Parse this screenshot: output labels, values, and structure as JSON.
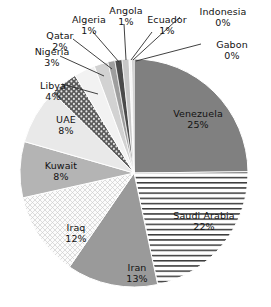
{
  "chart_data": {
    "type": "pie",
    "title": "",
    "subtitle": "",
    "xlabel": "",
    "ylabel": "",
    "grid": false,
    "legend": "none",
    "label_format": "name + percent",
    "units": "percent of total",
    "categories": [
      "Venezuela",
      "Saudi Arabia",
      "Iran",
      "Iraq",
      "Kuwait",
      "UAE",
      "Libya",
      "Nigeria",
      "Qatar",
      "Algeria",
      "Angola",
      "Ecuador",
      "Indonesia",
      "Gabon"
    ],
    "values": [
      25,
      22,
      13,
      12,
      8,
      8,
      4,
      3,
      2,
      1,
      1,
      1,
      0,
      0
    ],
    "slices": [
      {
        "name": "Venezuela",
        "value": 25,
        "label": "Venezuela",
        "percent": "25%",
        "fill": "#808080",
        "pattern": "solid"
      },
      {
        "name": "Saudi Arabia",
        "value": 22,
        "label": "Saudi Arabia",
        "percent": "22%",
        "fill": "#ffffff",
        "pattern": "horizontal-lines"
      },
      {
        "name": "Iran",
        "value": 13,
        "label": "Iran",
        "percent": "13%",
        "fill": "#9a9a9a",
        "pattern": "solid"
      },
      {
        "name": "Iraq",
        "value": 12,
        "label": "Iraq",
        "percent": "12%",
        "fill": "#fbfbfb",
        "pattern": "fine-grid"
      },
      {
        "name": "Kuwait",
        "value": 8,
        "label": "Kuwait",
        "percent": "8%",
        "fill": "#b4b4b4",
        "pattern": "solid"
      },
      {
        "name": "UAE",
        "value": 8,
        "label": "UAE",
        "percent": "8%",
        "fill": "#e9e9e9",
        "pattern": "solid"
      },
      {
        "name": "Libya",
        "value": 4,
        "label": "Libya",
        "percent": "4%",
        "fill": "#585858",
        "pattern": "dots"
      },
      {
        "name": "Nigeria",
        "value": 3,
        "label": "Nigeria",
        "percent": "3%",
        "fill": "#f2f2f2",
        "pattern": "solid"
      },
      {
        "name": "Qatar",
        "value": 2,
        "label": "Qatar",
        "percent": "2%",
        "fill": "#d2d2d2",
        "pattern": "solid"
      },
      {
        "name": "Algeria",
        "value": 1,
        "label": "Algeria",
        "percent": "1%",
        "fill": "#9e9e9e",
        "pattern": "solid"
      },
      {
        "name": "Angola",
        "value": 1,
        "label": "Angola",
        "percent": "1%",
        "fill": "#4a4a4a",
        "pattern": "solid"
      },
      {
        "name": "Ecuador",
        "value": 1,
        "label": "Ecuador",
        "percent": "1%",
        "fill": "#c8c8c8",
        "pattern": "solid"
      },
      {
        "name": "Indonesia",
        "value": 0.4,
        "label": "Indonesia",
        "percent": "0%",
        "fill": "#f6f6f6",
        "pattern": "solid"
      },
      {
        "name": "Gabon",
        "value": 0.3,
        "label": "Gabon",
        "percent": "0%",
        "fill": "#bdbdbd",
        "pattern": "solid"
      }
    ]
  },
  "labels": {
    "venezuela": {
      "name": "Venezuela",
      "percent": "25%"
    },
    "saudi_arabia": {
      "name": "Saudi Arabia",
      "percent": "22%"
    },
    "iran": {
      "name": "Iran",
      "percent": "13%"
    },
    "iraq": {
      "name": "Iraq",
      "percent": "12%"
    },
    "kuwait": {
      "name": "Kuwait",
      "percent": "8%"
    },
    "uae": {
      "name": "UAE",
      "percent": "8%"
    },
    "libya": {
      "name": "Libya",
      "percent": "4%"
    },
    "nigeria": {
      "name": "Nigeria",
      "percent": "3%"
    },
    "qatar": {
      "name": "Qatar",
      "percent": "2%"
    },
    "algeria": {
      "name": "Algeria",
      "percent": "1%"
    },
    "angola": {
      "name": "Angola",
      "percent": "1%"
    },
    "ecuador": {
      "name": "Ecuador",
      "percent": "1%"
    },
    "indonesia": {
      "name": "Indonesia",
      "percent": "0%"
    },
    "gabon": {
      "name": "Gabon",
      "percent": "0%"
    }
  }
}
